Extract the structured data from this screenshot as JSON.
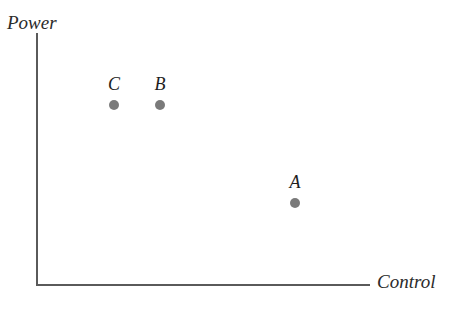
{
  "figure": {
    "background_color": "#ffffff",
    "axis_color": "#5a5a5a",
    "point_color": "#7a7a7a",
    "label_color": "#1e1e1e"
  },
  "axes": {
    "y_title": "Power",
    "x_title": "Control"
  },
  "chart_data": {
    "type": "scatter",
    "title": "",
    "xlabel": "Control",
    "ylabel": "Power",
    "grid": false,
    "legend": "none",
    "axis_style": "open-corner-no-ticks",
    "xlim": [
      0,
      1
    ],
    "ylim": [
      0,
      1
    ],
    "points": [
      {
        "label": "C",
        "x_px": 114,
        "y_px": 105,
        "x": 0.23,
        "y": 0.71
      },
      {
        "label": "B",
        "x_px": 160,
        "y_px": 105,
        "x": 0.37,
        "y": 0.71
      },
      {
        "label": "A",
        "x_px": 295,
        "y_px": 203,
        "x": 0.78,
        "y": 0.32
      }
    ]
  }
}
